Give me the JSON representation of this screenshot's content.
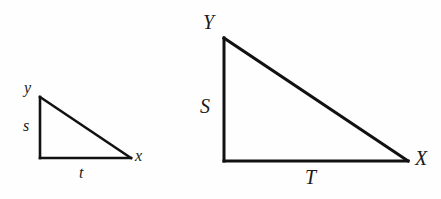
{
  "figure": {
    "caption": "",
    "background_color": "#fefefe",
    "stroke_color": "#111111",
    "text_color": "#1a1a1a",
    "triangles": [
      {
        "id": "small-triangle",
        "name": "small right triangle",
        "right_angle_at": "bottom-left",
        "vertices": {
          "apex": {
            "x": 40,
            "y": 97
          },
          "right_angle": {
            "x": 40,
            "y": 158
          },
          "far": {
            "x": 131,
            "y": 158
          }
        },
        "vertex_labels": {
          "apex": "y",
          "far": "x"
        },
        "side_labels": {
          "vertical_leg": "s",
          "horizontal_leg": "t"
        }
      },
      {
        "id": "large-triangle",
        "name": "large right triangle",
        "right_angle_at": "bottom-left",
        "vertices": {
          "apex": {
            "x": 224,
            "y": 38
          },
          "right_angle": {
            "x": 224,
            "y": 161
          },
          "far": {
            "x": 408,
            "y": 161
          }
        },
        "vertex_labels": {
          "apex": "Y",
          "far": "X"
        },
        "side_labels": {
          "vertical_leg": "S",
          "horizontal_leg": "T"
        }
      }
    ]
  }
}
